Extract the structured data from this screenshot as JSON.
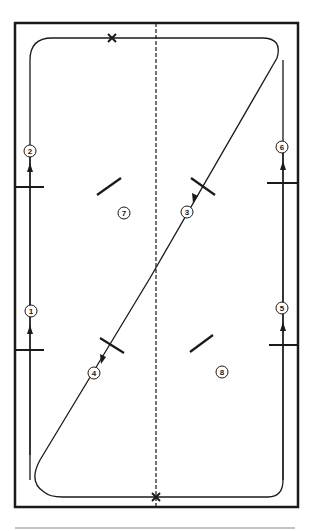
{
  "diagram": {
    "type": "arena-riding-pattern",
    "markers": [
      {
        "id": "1",
        "label": "1",
        "x": 31,
        "y": 311
      },
      {
        "id": "2",
        "label": "2",
        "x": 30,
        "y": 151
      },
      {
        "id": "3",
        "label": "3",
        "x": 187,
        "y": 212
      },
      {
        "id": "4",
        "label": "4",
        "x": 94,
        "y": 373
      },
      {
        "id": "5",
        "label": "5",
        "x": 282,
        "y": 308
      },
      {
        "id": "6",
        "label": "6",
        "x": 282,
        "y": 147
      },
      {
        "id": "7",
        "label": "7",
        "x": 124,
        "y": 213
      },
      {
        "id": "8",
        "label": "8",
        "x": 222,
        "y": 372
      }
    ],
    "points_of_interest": [
      {
        "name": "X-top",
        "symbol": "×"
      },
      {
        "name": "X-bottom",
        "symbol": "×"
      }
    ],
    "colors": {
      "stroke": "#1a1a1a",
      "background": "#ffffff",
      "divider": "#888888"
    }
  }
}
